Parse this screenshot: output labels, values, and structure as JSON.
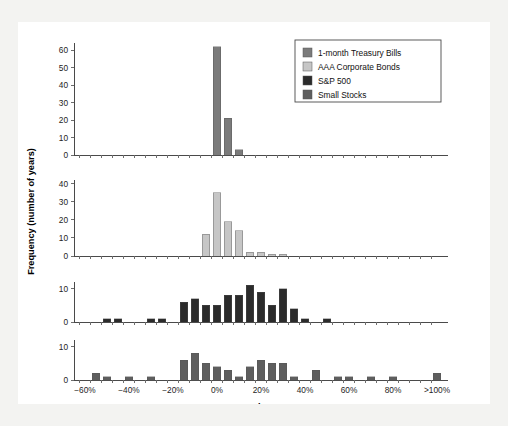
{
  "figure": {
    "background_color": "#f3f3f1",
    "panel_color": "#ffffff",
    "ylabel": "Frequency (number of years)",
    "xlabel": "Annual Return"
  },
  "legend": {
    "position": "top-right",
    "items": [
      {
        "label": "1-month Treasury Bills",
        "color": "#7b7b7b"
      },
      {
        "label": "AAA Corporate Bonds",
        "color": "#c6c6c6"
      },
      {
        "label": "S&P 500",
        "color": "#2b2b2b"
      },
      {
        "label": "Small Stocks",
        "color": "#5e5e5e"
      }
    ]
  },
  "chart_data": {
    "type": "bar",
    "title": "",
    "subtitle": "",
    "xlabel": "Annual Return",
    "ylabel": "Frequency (number of years)",
    "grid": false,
    "legend_position": "top-right",
    "bin_width_percent": 5,
    "x_bin_starts": [
      -60,
      -55,
      -50,
      -45,
      -40,
      -35,
      -30,
      -25,
      -20,
      -15,
      -10,
      -5,
      0,
      5,
      10,
      15,
      20,
      25,
      30,
      35,
      40,
      45,
      50,
      55,
      60,
      65,
      70,
      75,
      80,
      85,
      90,
      95,
      100
    ],
    "xtick_labels": [
      "−60%",
      "−40%",
      "−20%",
      "0%",
      "20%",
      "40%",
      "60%",
      "80%",
      ">100%"
    ],
    "xtick_values": [
      -60,
      -40,
      -20,
      0,
      20,
      40,
      60,
      80,
      100
    ],
    "xlim": [
      -62.5,
      107.5
    ],
    "panels": [
      {
        "name": "1-month Treasury Bills",
        "color": "#7b7b7b",
        "ylim": [
          0,
          64
        ],
        "ytick_values": [
          0,
          10,
          20,
          30,
          40,
          50,
          60
        ],
        "ytick_labels": [
          "0",
          "10",
          "20",
          "30",
          "40",
          "50",
          "60"
        ],
        "values": [
          0,
          0,
          0,
          0,
          0,
          0,
          0,
          0,
          0,
          0,
          0,
          0,
          62,
          21,
          3,
          0,
          0,
          0,
          0,
          0,
          0,
          0,
          0,
          0,
          0,
          0,
          0,
          0,
          0,
          0,
          0,
          0,
          0
        ]
      },
      {
        "name": "AAA Corporate Bonds",
        "color": "#c6c6c6",
        "ylim": [
          0,
          42
        ],
        "ytick_values": [
          0,
          10,
          20,
          30,
          40
        ],
        "ytick_labels": [
          "0",
          "10",
          "20",
          "30",
          "40"
        ],
        "values": [
          0,
          0,
          0,
          0,
          0,
          0,
          0,
          0,
          0,
          0,
          0,
          12,
          35,
          19,
          14,
          2,
          2,
          1,
          1,
          0,
          0,
          0,
          0,
          0,
          0,
          0,
          0,
          0,
          0,
          0,
          0,
          0,
          0
        ]
      },
      {
        "name": "S&P 500",
        "color": "#2b2b2b",
        "ylim": [
          0,
          12
        ],
        "ytick_values": [
          0,
          10
        ],
        "ytick_labels": [
          "0",
          "10"
        ],
        "values": [
          0,
          0,
          1,
          1,
          0,
          0,
          1,
          1,
          0,
          6,
          7,
          5,
          5,
          8,
          8,
          11,
          9,
          5,
          10,
          4,
          1,
          0,
          1,
          0,
          0,
          0,
          0,
          0,
          0,
          0,
          0,
          0,
          0
        ]
      },
      {
        "name": "Small Stocks",
        "color": "#5e5e5e",
        "ylim": [
          0,
          12
        ],
        "ytick_values": [
          0,
          10
        ],
        "ytick_labels": [
          "0",
          "10"
        ],
        "values": [
          0,
          2,
          1,
          0,
          1,
          0,
          1,
          0,
          0,
          6,
          8,
          5,
          4,
          3,
          1,
          4,
          6,
          5,
          5,
          1,
          0,
          3,
          0,
          1,
          1,
          0,
          1,
          0,
          1,
          0,
          0,
          0,
          2
        ]
      }
    ]
  }
}
